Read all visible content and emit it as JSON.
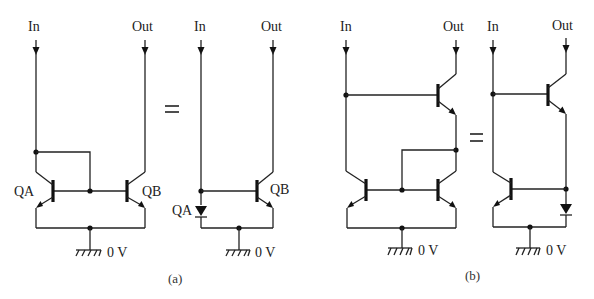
{
  "figure": {
    "colors": {
      "ink": "#222222",
      "background": "#ffffff"
    }
  },
  "circuit_a": {
    "caption": "(a)",
    "equals": "=",
    "left": {
      "input_label": "In",
      "output_label": "Out",
      "transistor_a_label": "QA",
      "transistor_b_label": "QB",
      "ground_label": "0 V"
    },
    "right": {
      "input_label": "In",
      "output_label": "Out",
      "diode_label": "QA",
      "transistor_b_label": "QB",
      "ground_label": "0 V"
    }
  },
  "circuit_b": {
    "caption": "(b)",
    "equals": "=",
    "left": {
      "input_label": "In",
      "output_label": "Out",
      "ground_label": "0 V"
    },
    "right": {
      "input_label": "In",
      "output_label": "Out",
      "ground_label": "0 V"
    }
  }
}
